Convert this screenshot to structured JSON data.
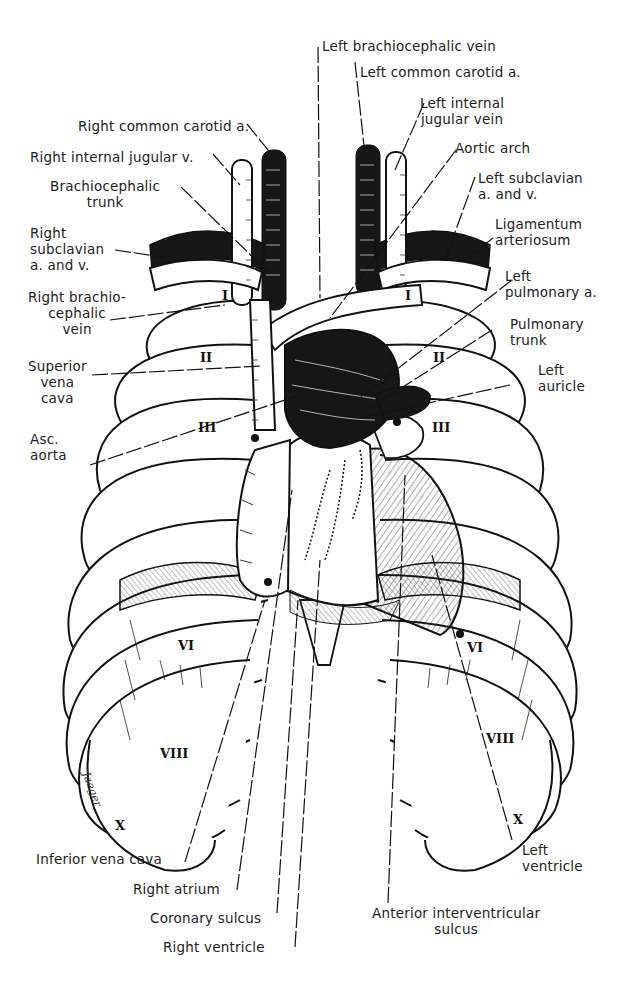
{
  "figure": {
    "type": "anatomical line illustration",
    "signature": "Jaeger"
  },
  "labels": {
    "left_brachiocephalic_vein": "Left brachiocephalic vein",
    "left_common_carotid": "Left common carotid a.",
    "left_internal_jugular": "Left internal\njugular vein",
    "right_common_carotid": "Right common carotid a.",
    "aortic_arch": "Aortic arch",
    "right_internal_jugular": "Right internal jugular v.",
    "brachiocephalic_trunk": "Brachiocephalic\ntrunk",
    "left_subclavian": "Left subclavian\na. and v.",
    "right_subclavian": "Right\nsubclavian\na. and v.",
    "ligamentum_arteriosum": "Ligamentum\narteriosum",
    "right_brachiocephalic_vein": "Right brachio-\ncephalic\nvein",
    "left_pulmonary_a": "Left\npulmonary a.",
    "pulmonary_trunk": "Pulmonary\ntrunk",
    "superior_vena_cava": "Superior\nvena\ncava",
    "left_auricle": "Left\nauricle",
    "asc_aorta": "Asc.\naorta",
    "inferior_vena_cava": "Inferior vena cava",
    "left_ventricle": "Left\nventricle",
    "right_atrium": "Right atrium",
    "coronary_sulcus": "Coronary sulcus",
    "anterior_interventricular_sulcus": "Anterior interventricular\nsulcus",
    "right_ventricle": "Right ventricle"
  },
  "rib_numerals": {
    "right": [
      "I",
      "II",
      "III",
      "VI",
      "VIII",
      "X"
    ],
    "left": [
      "I",
      "II",
      "III",
      "VI",
      "VIII",
      "X"
    ]
  },
  "colors": {
    "ink": "#111111",
    "paper": "#ffffff",
    "vessel_dark": "#161616"
  }
}
